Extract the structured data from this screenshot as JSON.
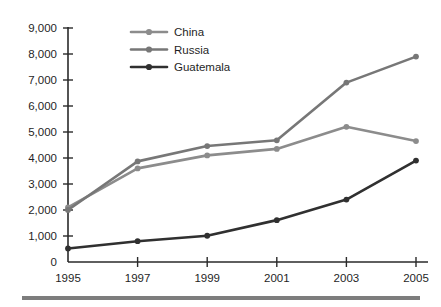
{
  "chart_data": {
    "type": "line",
    "title": "",
    "subtitle": "",
    "xlabel": "",
    "ylabel": "",
    "categories": [
      "1995",
      "1997",
      "1999",
      "2001",
      "2003",
      "2005"
    ],
    "x_tick_labels": [
      "1995",
      "1997",
      "1999",
      "2001",
      "2003",
      "2005"
    ],
    "y_tick_labels": [
      "0",
      "1,000",
      "2,000",
      "3,000",
      "4,000",
      "5,000",
      "6,000",
      "7,000",
      "8,000",
      "9,000"
    ],
    "y_tick_values": [
      0,
      1000,
      2000,
      3000,
      4000,
      5000,
      6000,
      7000,
      8000,
      9000
    ],
    "ylim": [
      0,
      9000
    ],
    "grid": false,
    "legend_position": "top-left-inside",
    "series": [
      {
        "name": "China",
        "color": "#8c8c8c",
        "marker": "circle",
        "values": [
          2100,
          3600,
          4100,
          4350,
          5200,
          4650
        ]
      },
      {
        "name": "Russia",
        "color": "#777777",
        "marker": "circle",
        "values": [
          2000,
          3870,
          4460,
          4680,
          6900,
          7900
        ]
      },
      {
        "name": "Guatemala",
        "color": "#303030",
        "marker": "circle",
        "values": [
          520,
          800,
          1010,
          1610,
          2400,
          3900
        ]
      }
    ]
  },
  "legend": {
    "items": [
      {
        "label": "China"
      },
      {
        "label": "Russia"
      },
      {
        "label": "Guatemala"
      }
    ]
  },
  "footer": {
    "rule_color": "#7d7d7d"
  }
}
